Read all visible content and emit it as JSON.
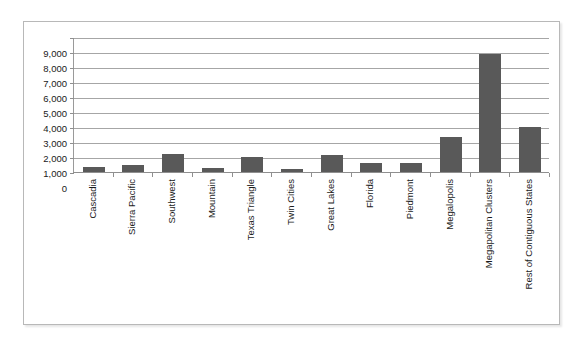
{
  "chart_data": {
    "type": "bar",
    "title": "",
    "subtitle": "",
    "xlabel": "",
    "ylabel": "",
    "ylim": [
      0,
      9000
    ],
    "ytick_step": 1000,
    "ytick_labels": [
      "9,000",
      "8,000",
      "7,000",
      "6,000",
      "5,000",
      "4,000",
      "3,000",
      "2,000",
      "1,000",
      "0"
    ],
    "ytick_values": [
      9000,
      8000,
      7000,
      6000,
      5000,
      4000,
      3000,
      2000,
      1000,
      0
    ],
    "grid": true,
    "legend": false,
    "legend_position": "none",
    "bar_color": "#595959",
    "gridline_color": "#a6a6a6",
    "axis_color": "#8f8f8f",
    "categories": [
      "Cascadia",
      "Sierra Pacific",
      "Southwest",
      "Mountain",
      "Texas Triangle",
      "Twin Cities",
      "Great Lakes",
      "Florida",
      "Piedmont",
      "Megalopolis",
      "Megapolitan Clusters",
      "Rest of Contiguous States"
    ],
    "values": [
      330,
      500,
      1230,
      280,
      970,
      220,
      1110,
      620,
      620,
      2350,
      7880,
      3010
    ]
  }
}
